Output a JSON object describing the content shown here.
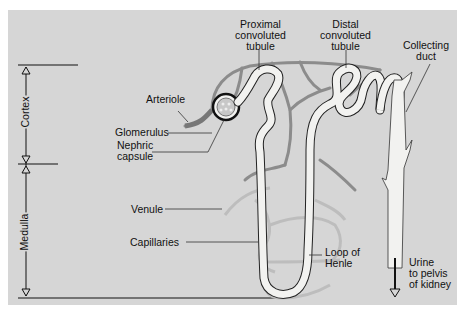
{
  "diagram": {
    "colors": {
      "background": "#d6d6d6",
      "vessel": "#8c8c8c",
      "capillary_light": "#bdbdbd",
      "tubule_fill": "#f2f2f0",
      "outline": "#222222"
    },
    "regions": [
      {
        "label": "Cortex"
      },
      {
        "label": "Medulla"
      }
    ],
    "labels": {
      "proximal": [
        "Proximal",
        "convoluted",
        "tubule"
      ],
      "distal": [
        "Distal",
        "convoluted",
        "tubule"
      ],
      "collecting": [
        "Collecting",
        "duct"
      ],
      "arteriole": "Arteriole",
      "glomerulus": "Glomerulus",
      "nephric": [
        "Nephric",
        "capsule"
      ],
      "venule": "Venule",
      "capillaries": "Capillaries",
      "loop": [
        "Loop of",
        "Henle"
      ],
      "urine": [
        "Urine",
        "to pelvis",
        "of kidney"
      ]
    }
  }
}
